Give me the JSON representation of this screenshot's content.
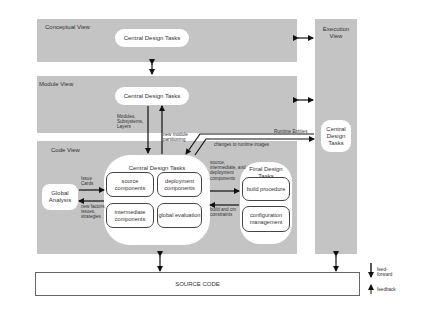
{
  "views": {
    "conceptual": {
      "title": "Conceptual View",
      "task": "Central Design Tasks"
    },
    "module": {
      "title": "Module View",
      "task": "Central Design Tasks"
    },
    "code": {
      "title": "Code View",
      "central_title": "Central Design Tasks",
      "central_items": [
        "source components",
        "deployment components",
        "intermediate components",
        "global evaluation"
      ],
      "final_title": "Final Design Tasks",
      "final_items": [
        "build procedure",
        "configuration management"
      ],
      "global_analysis": "Global Analysis"
    },
    "execution": {
      "title": "Execution View",
      "task": "Central Design Tasks"
    }
  },
  "flows": {
    "modules_label": "Modules, Subsystems, Layers",
    "partitioning_label": "new module partitioning",
    "runtime_label": "Runtime Entities",
    "changes_label": "changes to runtime images",
    "issue_cards_label": "Issue Cards",
    "new_factors_label": "new factors, issues, strategies",
    "source_label": "source, intermediate, and deployment components",
    "build_label": "build and cm constraints"
  },
  "source_code": "SOURCE CODE",
  "legend": {
    "feedforward": "feed-forward",
    "feedback": "feedback"
  },
  "colors": {
    "panel": "#c4c4c4",
    "box": "#ffffff",
    "arrow": "#111111"
  }
}
